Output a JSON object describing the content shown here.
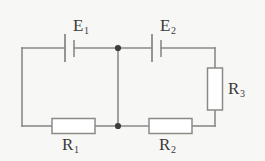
{
  "figure": {
    "kind": "circuit-diagram",
    "title": "",
    "background_color": "#f7f7f5",
    "wire_color": "#8a8a88",
    "label_color": "#3a3a3a",
    "component_fill": "#ffffff"
  },
  "labels": {
    "e1": {
      "symbol": "E",
      "subscript": "1"
    },
    "e2": {
      "symbol": "E",
      "subscript": "2"
    },
    "r1": {
      "symbol": "R",
      "subscript": "1"
    },
    "r2": {
      "symbol": "R",
      "subscript": "2"
    },
    "r3": {
      "symbol": "R",
      "subscript": "3"
    }
  },
  "components": [
    {
      "name": "battery-e1",
      "type": "battery",
      "orientation": "horizontal",
      "label": "E1"
    },
    {
      "name": "battery-e2",
      "type": "battery",
      "orientation": "horizontal",
      "label": "E2"
    },
    {
      "name": "resistor-r1",
      "type": "resistor",
      "orientation": "horizontal",
      "label": "R1"
    },
    {
      "name": "resistor-r2",
      "type": "resistor",
      "orientation": "horizontal",
      "label": "R2"
    },
    {
      "name": "resistor-r3",
      "type": "resistor",
      "orientation": "vertical",
      "label": "R3"
    }
  ],
  "nodes": [
    {
      "name": "junction-top",
      "x": 118,
      "y": 48
    },
    {
      "name": "junction-bottom",
      "x": 118,
      "y": 126
    }
  ]
}
